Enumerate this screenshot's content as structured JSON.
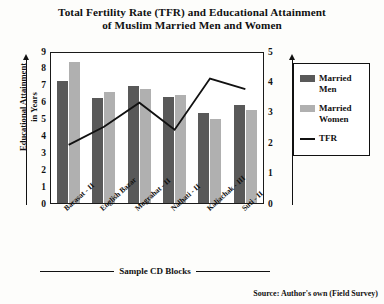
{
  "title_line1": "Total Fertility Rate (TFR) and Educational Attainment",
  "title_line2": "of Muslim Married Men and Women",
  "axis": {
    "left_label_line1": "Educational Attainment",
    "left_label_line2": "in Years",
    "right_label": "TFR",
    "x_caption": "Sample CD Blocks"
  },
  "legend": {
    "men": "Married Men",
    "men_line1": "Married",
    "men_line2": "Men",
    "women_line1": "Married",
    "women_line2": "Women",
    "tfr": "TFR"
  },
  "source": "Source: Author's own (Field Survey)",
  "colors": {
    "men": "#595959",
    "women": "#b0b0b0",
    "tfr_line": "#111111"
  },
  "chart_data": {
    "type": "bar",
    "title": "Total Fertility Rate (TFR) and Educational Attainment of Muslim Married Men and Women",
    "xlabel": "Sample CD Blocks",
    "ylabel": "Educational Attainment in Years",
    "y2label": "TFR",
    "ylim": [
      0,
      9
    ],
    "y2lim": [
      0,
      5
    ],
    "yticks": [
      0,
      1,
      2,
      3,
      4,
      5,
      6,
      7,
      8,
      9
    ],
    "y2ticks": [
      0,
      1,
      2,
      3,
      4,
      5
    ],
    "grid": false,
    "legend_position": "right",
    "categories": [
      "Barasat - II",
      "English Bazar",
      "Mograhat - II",
      "Nalhati - II",
      "Kaliachak - III",
      "Suti - II"
    ],
    "series": [
      {
        "name": "Married Men",
        "type": "bar",
        "axis": "left",
        "values": [
          7.25,
          6.2,
          6.9,
          6.3,
          5.35,
          5.8
        ]
      },
      {
        "name": "Married Women",
        "type": "bar",
        "axis": "left",
        "values": [
          8.35,
          6.6,
          6.75,
          6.4,
          5.0,
          5.5
        ]
      },
      {
        "name": "TFR",
        "type": "line",
        "axis": "right",
        "values": [
          1.95,
          2.55,
          3.35,
          2.45,
          4.15,
          3.8
        ]
      }
    ]
  }
}
